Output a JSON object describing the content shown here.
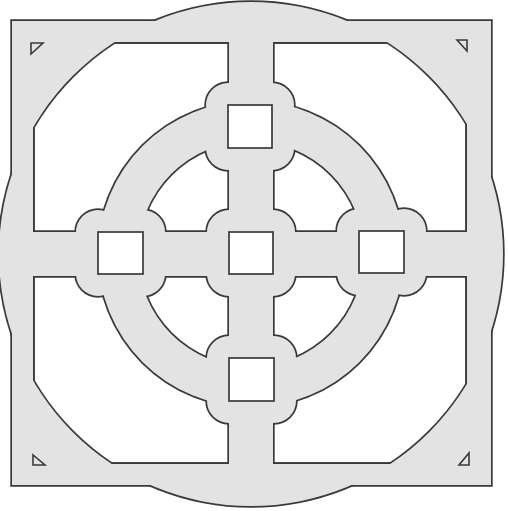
{
  "diagram": {
    "title": "Square lattice grille panel with circular ring",
    "canvas": {
      "width": 508,
      "height": 511,
      "background": "#ffffff"
    },
    "colors": {
      "fill": "#e3e3e3",
      "stroke": "#3a3a3a",
      "opening": "#ffffff"
    },
    "frame": {
      "outer": {
        "x": 12,
        "y": 21,
        "w": 479,
        "h": 464
      },
      "inner": {
        "x": 33,
        "y": 42,
        "w": 434,
        "h": 422
      }
    },
    "center": {
      "cx": 251,
      "cy": 254
    },
    "corner_arc_radius": 252,
    "ring": {
      "outer_r": 153,
      "inner_r": 113
    },
    "bars": {
      "vertical": {
        "x": 229,
        "w": 44
      },
      "horizontal": {
        "y": 232,
        "h": 44
      }
    },
    "lobe_radius": 22,
    "squares": [
      {
        "name": "top",
        "x": 228,
        "y": 105,
        "w": 44,
        "h": 43
      },
      {
        "name": "left",
        "x": 98,
        "y": 232,
        "w": 45,
        "h": 42
      },
      {
        "name": "center",
        "x": 229,
        "y": 232,
        "w": 44,
        "h": 42
      },
      {
        "name": "right",
        "x": 359,
        "y": 231,
        "w": 45,
        "h": 42
      },
      {
        "name": "bottom",
        "x": 229,
        "y": 358,
        "w": 45,
        "h": 43
      }
    ],
    "corner_marks": [
      {
        "name": "top-left",
        "points": "31,43 43,43 31,54"
      },
      {
        "name": "top-right",
        "points": "457,40 467,40 467,51"
      },
      {
        "name": "bottom-left",
        "points": "33,455 33,465 45,465"
      },
      {
        "name": "bottom-right",
        "points": "469,453 469,465 459,465"
      }
    ]
  }
}
